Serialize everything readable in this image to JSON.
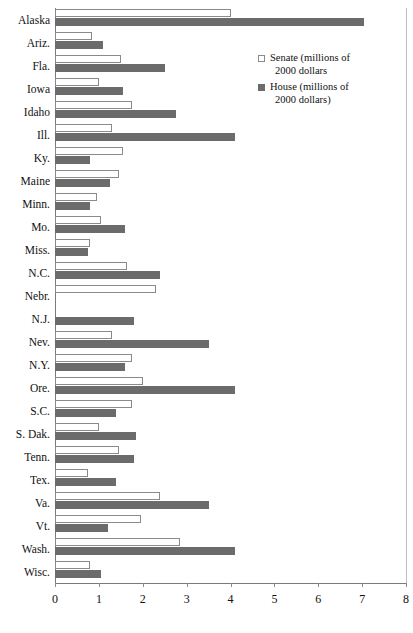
{
  "chart_data": {
    "type": "bar",
    "orientation": "horizontal",
    "title": "",
    "subtitle": "",
    "xlabel": "",
    "ylabel": "",
    "xlim": [
      0,
      8
    ],
    "xticks": [
      0,
      1,
      2,
      3,
      4,
      5,
      6,
      7,
      8
    ],
    "xtick_labels": [
      "0",
      "1",
      "2",
      "3",
      "4",
      "5",
      "6",
      "7",
      "8"
    ],
    "grid": false,
    "legend_position": "top-right",
    "categories": [
      "Alaska",
      "Ariz.",
      "Fla.",
      "Iowa",
      "Idaho",
      "Ill.",
      "Ky.",
      "Maine",
      "Minn.",
      "Mo.",
      "Miss.",
      "N.C.",
      "Nebr.",
      "N.J.",
      "Nev.",
      "N.Y.",
      "Ore.",
      "S.C.",
      "S. Dak.",
      "Tenn.",
      "Tex.",
      "Va.",
      "Vt.",
      "Wash.",
      "Wisc."
    ],
    "series": [
      {
        "name": "Senate (millions of 2000 dollars",
        "color": "#ffffff",
        "edge_color": "#8a8a8a",
        "values": [
          4.0,
          0.85,
          1.5,
          1.0,
          1.75,
          1.3,
          1.55,
          1.45,
          0.95,
          1.05,
          0.8,
          1.65,
          2.3,
          0.0,
          1.3,
          1.75,
          2.0,
          1.75,
          1.0,
          1.45,
          0.75,
          2.4,
          1.95,
          2.85,
          0.8
        ]
      },
      {
        "name": "House (millions of 2000 dollars)",
        "color": "#6b6b6b",
        "edge_color": "#6b6b6b",
        "values": [
          7.05,
          1.1,
          2.5,
          1.55,
          2.75,
          4.1,
          0.8,
          1.25,
          0.8,
          1.6,
          0.75,
          2.4,
          0.0,
          1.8,
          3.5,
          1.6,
          4.1,
          1.4,
          1.85,
          1.8,
          1.4,
          3.5,
          1.2,
          4.1,
          1.05
        ]
      }
    ]
  },
  "legend": {
    "items": [
      {
        "swatch": "senate",
        "line1": "Senate (millions of",
        "line2": "2000 dollars"
      },
      {
        "swatch": "house",
        "line1": "House (millions of",
        "line2": "2000 dollars)"
      }
    ]
  },
  "colors": {
    "senate_fill": "#ffffff",
    "senate_edge": "#8a8a8a",
    "house_fill": "#6b6b6b",
    "axis": "#7a7a7a",
    "text": "#111111",
    "background": "#ffffff"
  }
}
